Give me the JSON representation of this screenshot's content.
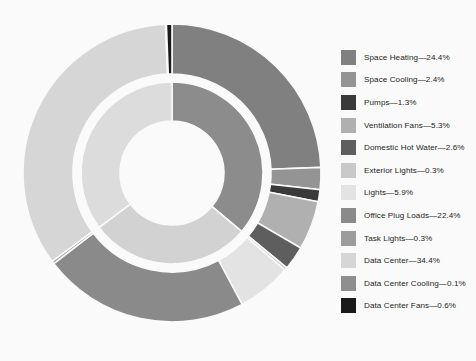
{
  "chart_data": {
    "type": "pie",
    "title": "",
    "subtype": "nested-donut-sunburst",
    "legend_position": "right",
    "grid": false,
    "units": "percent",
    "background_color": "#fafafa",
    "categories": [
      "Space Heating",
      "Space Cooling",
      "Pumps",
      "Ventilation Fans",
      "Domestic Hot Water",
      "Exterior Lights",
      "Lights",
      "Office Plug Loads",
      "Task Lights",
      "Data Center",
      "Data Center Cooling",
      "Data Center Fans"
    ],
    "values": [
      24.4,
      2.4,
      1.3,
      5.3,
      2.6,
      0.3,
      5.9,
      22.4,
      0.3,
      34.4,
      0.1,
      0.6
    ],
    "colors": [
      "#808080",
      "#949494",
      "#3a3a3a",
      "#b0b0b0",
      "#5e5e5e",
      "#c9c9c9",
      "#e3e3e3",
      "#8a8a8a",
      "#9c9c9c",
      "#d6d6d6",
      "#8f8f8f",
      "#1a1a1a"
    ],
    "inner_ring_groups": [
      {
        "label": "HVAC",
        "value": 36.0,
        "color": "#8c8c8c"
      },
      {
        "label": "Lighting + Plug",
        "value": 28.6,
        "color": "#d2d2d2"
      },
      {
        "label": "Data Center",
        "value": 35.1,
        "color": "#dcdcdc"
      }
    ]
  },
  "legend": {
    "separator": "—",
    "items": [
      {
        "label": "Space Heating",
        "value": "24.4%",
        "text": "Space Heating—24.4%",
        "color": "#808080"
      },
      {
        "label": "Space Cooling",
        "value": "2.4%",
        "text": "Space Cooling—2.4%",
        "color": "#949494"
      },
      {
        "label": "Pumps",
        "value": "1.3%",
        "text": "Pumps—1.3%",
        "color": "#3a3a3a"
      },
      {
        "label": "Ventilation Fans",
        "value": "5.3%",
        "text": "Ventilation Fans—5.3%",
        "color": "#b0b0b0"
      },
      {
        "label": "Domestic Hot Water",
        "value": "2.6%",
        "text": "Domestic Hot Water—2.6%",
        "color": "#5e5e5e"
      },
      {
        "label": "Exterior Lights",
        "value": "0.3%",
        "text": "Exterior Lights—0.3%",
        "color": "#c9c9c9"
      },
      {
        "label": "Lights",
        "value": "5.9%",
        "text": "Lights—5.9%",
        "color": "#e3e3e3"
      },
      {
        "label": "Office Plug Loads",
        "value": "22.4%",
        "text": "Office Plug Loads—22.4%",
        "color": "#8a8a8a"
      },
      {
        "label": "Task Lights",
        "value": "0.3%",
        "text": "Task Lights—0.3%",
        "color": "#9c9c9c"
      },
      {
        "label": "Data Center",
        "value": "34.4%",
        "text": "Data Center—34.4%",
        "color": "#d6d6d6"
      },
      {
        "label": "Data Center Cooling",
        "value": "0.1%",
        "text": "Data Center Cooling—0.1%",
        "color": "#8f8f8f"
      },
      {
        "label": "Data Center Fans",
        "value": "0.6%",
        "text": "Data Center Fans—0.6%",
        "color": "#1a1a1a"
      }
    ]
  }
}
